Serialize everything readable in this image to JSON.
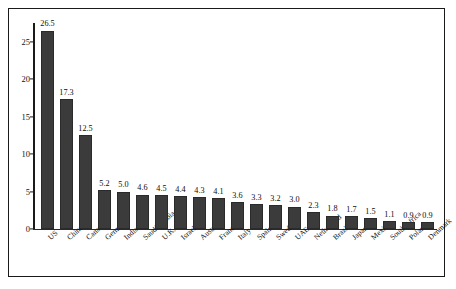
{
  "chart_data": {
    "type": "bar",
    "title": "",
    "subtitle": "",
    "xlabel": "",
    "ylabel": "",
    "ylim": [
      0,
      27.5
    ],
    "yticks": [
      0,
      5,
      10,
      15,
      20,
      25
    ],
    "ytick_labels": [
      "0",
      "5",
      "10",
      "15",
      "20",
      "25"
    ],
    "grid": false,
    "legend": null,
    "bar_color": "#3b3b3b",
    "frame_color": "#1a1a1a",
    "categories": [
      "US",
      "China",
      "Canada",
      "Germany",
      "India",
      "Saudi Arabia",
      "U.K.",
      "Israel",
      "Australia",
      "France",
      "Italy",
      "Spain",
      "Sweden",
      "UAE",
      "Netherland",
      "Brazil",
      "Japan",
      "Mexico",
      "South Africa",
      "Poland",
      "Denmark"
    ],
    "values": [
      26.5,
      17.3,
      12.5,
      5.2,
      5.0,
      4.6,
      4.5,
      4.4,
      4.3,
      4.1,
      3.6,
      3.3,
      3.2,
      3.0,
      2.3,
      1.8,
      1.7,
      1.5,
      1.1,
      0.9,
      0.9
    ],
    "value_labels": [
      "26.5",
      "17.3",
      "12.5",
      "5.2",
      "5.0",
      "4.6",
      "4.5",
      "4.4",
      "4.3",
      "4.1",
      "3.6",
      "3.3",
      "3.2",
      "3.0",
      "2.3",
      "1.8",
      "1.7",
      "1.5",
      "1.1",
      "0.9",
      "0.9"
    ]
  }
}
